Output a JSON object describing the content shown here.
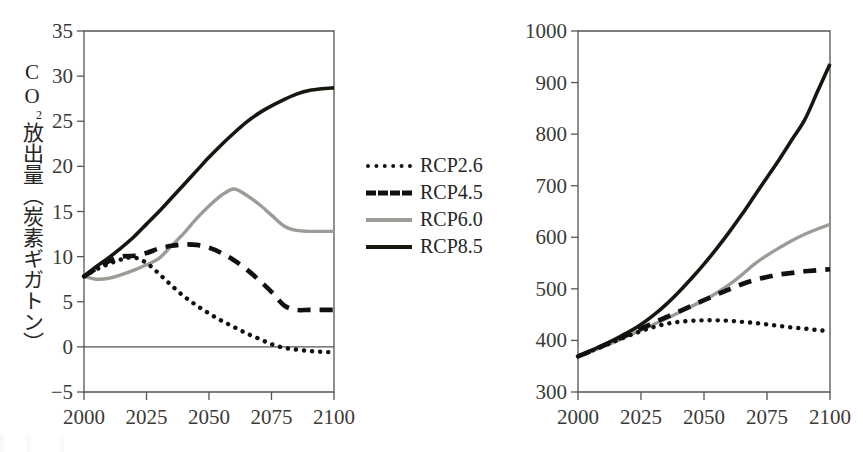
{
  "figure": {
    "background": "#ffffff",
    "ink": "#17170f",
    "gray_series": "#9c9c97"
  },
  "legend": {
    "position": "center-between-panels",
    "entries": [
      {
        "label": "RCP2.6",
        "style": "dotted",
        "color": "#111110"
      },
      {
        "label": "RCP4.5",
        "style": "dashed",
        "color": "#111110"
      },
      {
        "label": "RCP6.0",
        "style": "solid",
        "color": "#9c9c97"
      },
      {
        "label": "RCP8.5",
        "style": "solid",
        "color": "#17170f"
      }
    ]
  },
  "chart_data": [
    {
      "type": "line",
      "id": "co2-emissions",
      "title": "",
      "xlabel": "",
      "ylabel": "CO2放出量（炭素ギガトン）",
      "ylabel_parts": {
        "main": "CO",
        "sub": "2",
        "rest": "放出量（炭素ギガトン）"
      },
      "xlim": [
        2000,
        2100
      ],
      "ylim": [
        -5,
        35
      ],
      "xticks": [
        2000,
        2025,
        2050,
        2075,
        2100
      ],
      "yticks": [
        -5,
        0,
        5,
        10,
        15,
        20,
        25,
        30,
        35
      ],
      "grid": false,
      "zero_line": true,
      "x": [
        2000,
        2005,
        2010,
        2015,
        2020,
        2025,
        2030,
        2035,
        2040,
        2045,
        2050,
        2055,
        2060,
        2065,
        2070,
        2075,
        2080,
        2085,
        2090,
        2095,
        2100
      ],
      "series": [
        {
          "name": "RCP2.6",
          "style": "dotted",
          "color": "#111110",
          "values": [
            7.8,
            8.6,
            9.2,
            9.7,
            9.9,
            9.3,
            8.1,
            6.8,
            5.6,
            4.6,
            3.7,
            2.9,
            2.2,
            1.5,
            0.9,
            0.3,
            -0.1,
            -0.3,
            -0.45,
            -0.55,
            -0.6
          ]
        },
        {
          "name": "RCP4.5",
          "style": "dashed",
          "color": "#111110",
          "values": [
            7.8,
            8.7,
            9.5,
            10.0,
            10.1,
            10.4,
            10.9,
            11.2,
            11.35,
            11.3,
            11.0,
            10.4,
            9.6,
            8.6,
            7.4,
            6.1,
            4.6,
            4.1,
            4.1,
            4.1,
            4.1
          ]
        },
        {
          "name": "RCP6.0",
          "style": "solid",
          "color": "#9c9c97",
          "values": [
            7.8,
            7.5,
            7.6,
            8.0,
            8.5,
            9.1,
            9.8,
            11.2,
            12.6,
            14.2,
            15.6,
            16.8,
            17.5,
            16.8,
            15.8,
            14.6,
            13.4,
            12.9,
            12.8,
            12.8,
            12.8
          ]
        },
        {
          "name": "RCP8.5",
          "style": "solid",
          "color": "#17170f",
          "values": [
            7.8,
            8.9,
            9.9,
            11.0,
            12.2,
            13.6,
            15.0,
            16.5,
            18.0,
            19.5,
            21.0,
            22.4,
            23.7,
            24.9,
            25.9,
            26.7,
            27.4,
            28.0,
            28.4,
            28.6,
            28.7
          ]
        }
      ]
    },
    {
      "type": "line",
      "id": "co2-concentration",
      "title": "",
      "xlabel": "",
      "ylabel": "CO2濃度（ppm）",
      "ylabel_parts": {
        "main": "CO",
        "sub": "2",
        "rest": "濃度（ppm）"
      },
      "xlim": [
        2000,
        2100
      ],
      "ylim": [
        300,
        1000
      ],
      "xticks": [
        2000,
        2025,
        2050,
        2075,
        2100
      ],
      "yticks": [
        300,
        400,
        500,
        600,
        700,
        800,
        900,
        1000
      ],
      "grid": false,
      "zero_line": false,
      "x": [
        2000,
        2005,
        2010,
        2015,
        2020,
        2025,
        2030,
        2035,
        2040,
        2045,
        2050,
        2055,
        2060,
        2065,
        2070,
        2075,
        2080,
        2085,
        2090,
        2095,
        2100
      ],
      "series": [
        {
          "name": "RCP2.6",
          "style": "dotted",
          "color": "#111110",
          "values": [
            369,
            379,
            389,
            399,
            409,
            418,
            426,
            432,
            436,
            438,
            439,
            439,
            438,
            436,
            434,
            431,
            428,
            425,
            423,
            420,
            418
          ]
        },
        {
          "name": "RCP4.5",
          "style": "dashed",
          "color": "#111110",
          "values": [
            369,
            379,
            390,
            401,
            412,
            423,
            434,
            445,
            456,
            467,
            478,
            489,
            499,
            509,
            517,
            523,
            528,
            531,
            534,
            536,
            538
          ]
        },
        {
          "name": "RCP6.0",
          "style": "solid",
          "color": "#9c9c97",
          "values": [
            369,
            378,
            388,
            398,
            409,
            420,
            431,
            442,
            454,
            466,
            478,
            492,
            508,
            527,
            548,
            565,
            580,
            594,
            606,
            616,
            625
          ]
        },
        {
          "name": "RCP8.5",
          "style": "solid",
          "color": "#17170f",
          "values": [
            369,
            380,
            391,
            403,
            416,
            431,
            449,
            470,
            494,
            520,
            548,
            578,
            610,
            644,
            680,
            716,
            752,
            790,
            828,
            882,
            936
          ]
        }
      ]
    }
  ]
}
